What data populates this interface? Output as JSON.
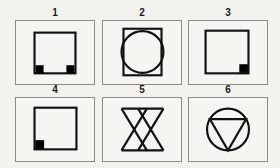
{
  "sheet": {
    "background_color": "#f4f2ef",
    "frame_stroke_color": "#8e8c89",
    "shape_stroke_color": "#111111",
    "marker_fill_color": "#000000",
    "columns": 3,
    "rows": 2,
    "total_panels": 6
  },
  "panels": [
    {
      "label": "1",
      "figure": "square-with-two-bottom-corner-markers",
      "description": "Open square outline with solid black small squares at bottom-left and bottom-right inner corners",
      "marker_count": 2,
      "marker_positions": [
        "bottom-left",
        "bottom-right"
      ]
    },
    {
      "label": "2",
      "figure": "square-with-inscribed-circle",
      "description": "Square outline with a circle whose diameter slightly exceeds the square width, bulging past the left and right sides",
      "marker_count": 0,
      "marker_positions": []
    },
    {
      "label": "3",
      "figure": "square-with-one-bottom-right-marker",
      "description": "Open square outline with a single solid black small square at the bottom-right inner corner",
      "marker_count": 1,
      "marker_positions": [
        "bottom-right"
      ]
    },
    {
      "label": "4",
      "figure": "square-with-one-bottom-left-marker",
      "description": "Open square outline with a single solid black small square at the bottom-left inner corner",
      "marker_count": 1,
      "marker_positions": [
        "bottom-left"
      ]
    },
    {
      "label": "5",
      "figure": "double-bowtie",
      "description": "Two overlapping hourglass/bowtie shapes side by side, joined by a top and a bottom horizontal line",
      "marker_count": 0,
      "marker_positions": []
    },
    {
      "label": "6",
      "figure": "circle-with-inscribed-downward-triangle",
      "description": "Circle outline containing a downward-pointing triangle whose three vertices touch the circle",
      "marker_count": 0,
      "marker_positions": []
    }
  ]
}
